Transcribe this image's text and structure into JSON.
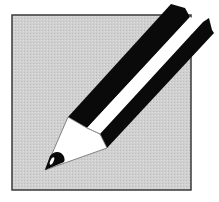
{
  "icon": {
    "name": "pencil-edit-icon",
    "description": "Pencil on a gray square"
  },
  "colors": {
    "background": "#ffffff",
    "square_fill": "#cfcfcf",
    "square_border": "#3a3a3a",
    "pencil_dark": "#0a0a0a",
    "pencil_light": "#ffffff",
    "wood": "#ffffff",
    "lead": "#0a0a0a"
  }
}
